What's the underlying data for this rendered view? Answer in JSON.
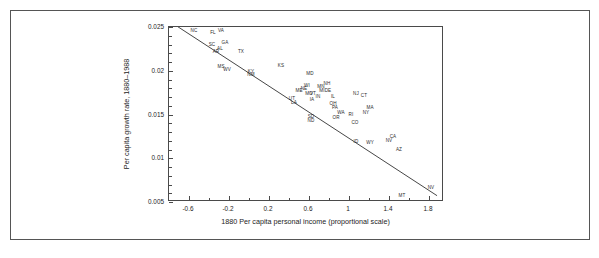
{
  "chart_data": {
    "type": "scatter",
    "title": "",
    "xlabel": "1880 Per capita personal income (proportional scale)",
    "ylabel": "Per capita growth rate, 1880–1988",
    "xlim": [
      -0.8,
      1.95
    ],
    "ylim": [
      0.005,
      0.025
    ],
    "xticks": [
      -0.6,
      -0.2,
      0.2,
      0.6,
      1,
      1.4,
      1.8
    ],
    "xticklabels": [
      "-0.6",
      "-0.2",
      "0.2",
      "0.6",
      "1",
      "1.4",
      "1.8"
    ],
    "xminor_step": 0.2,
    "yticks": [
      0.005,
      0.01,
      0.015,
      0.02,
      0.025
    ],
    "yticklabels": [
      "0.005",
      "0.01",
      "0.015",
      "0.02",
      "0.025"
    ],
    "yminor_step": 0.001,
    "grid": false,
    "legend": null,
    "point_label_field": "state",
    "fit_line": {
      "name": "regression line",
      "x": [
        -0.72,
        1.9
      ],
      "y": [
        0.0251,
        0.0055
      ]
    },
    "points": [
      {
        "state": "NC",
        "x": -0.55,
        "y": 0.0246
      },
      {
        "state": "FL",
        "x": -0.36,
        "y": 0.0243
      },
      {
        "state": "VA",
        "x": -0.28,
        "y": 0.0245
      },
      {
        "state": "SC",
        "x": -0.37,
        "y": 0.0229
      },
      {
        "state": "GA",
        "x": -0.24,
        "y": 0.0232
      },
      {
        "state": "AL",
        "x": -0.29,
        "y": 0.0225
      },
      {
        "state": "AR",
        "x": -0.33,
        "y": 0.0222
      },
      {
        "state": "TX",
        "x": -0.08,
        "y": 0.0222
      },
      {
        "state": "KS",
        "x": 0.32,
        "y": 0.0206
      },
      {
        "state": "MS",
        "x": -0.28,
        "y": 0.0204
      },
      {
        "state": "WV",
        "x": -0.22,
        "y": 0.0201
      },
      {
        "state": "KY",
        "x": 0.02,
        "y": 0.0199
      },
      {
        "state": "NM",
        "x": 0.02,
        "y": 0.0195
      },
      {
        "state": "MD",
        "x": 0.61,
        "y": 0.0196
      },
      {
        "state": "WI",
        "x": 0.58,
        "y": 0.0183
      },
      {
        "state": "NH",
        "x": 0.78,
        "y": 0.0185
      },
      {
        "state": "MN",
        "x": 0.72,
        "y": 0.0182
      },
      {
        "state": "NE",
        "x": 0.55,
        "y": 0.0179
      },
      {
        "state": "ME",
        "x": 0.5,
        "y": 0.0177
      },
      {
        "state": "MI",
        "x": 0.73,
        "y": 0.0177
      },
      {
        "state": "DE",
        "x": 0.79,
        "y": 0.0177
      },
      {
        "state": "VT",
        "x": 0.64,
        "y": 0.0174
      },
      {
        "state": "MO",
        "x": 0.6,
        "y": 0.0173
      },
      {
        "state": "IN",
        "x": 0.69,
        "y": 0.017
      },
      {
        "state": "IL",
        "x": 0.84,
        "y": 0.017
      },
      {
        "state": "IA",
        "x": 0.63,
        "y": 0.0167
      },
      {
        "state": "UT",
        "x": 0.43,
        "y": 0.0168
      },
      {
        "state": "LA",
        "x": 0.45,
        "y": 0.0163
      },
      {
        "state": "NJ",
        "x": 1.07,
        "y": 0.0174
      },
      {
        "state": "CT",
        "x": 1.15,
        "y": 0.0171
      },
      {
        "state": "OH",
        "x": 0.84,
        "y": 0.0162
      },
      {
        "state": "PA",
        "x": 0.86,
        "y": 0.0158
      },
      {
        "state": "MA",
        "x": 1.21,
        "y": 0.0157
      },
      {
        "state": "NY",
        "x": 1.17,
        "y": 0.0152
      },
      {
        "state": "SD",
        "x": 0.62,
        "y": 0.0147
      },
      {
        "state": "ND",
        "x": 0.62,
        "y": 0.0143
      },
      {
        "state": "WA",
        "x": 0.92,
        "y": 0.0152
      },
      {
        "state": "OR",
        "x": 0.87,
        "y": 0.0146
      },
      {
        "state": "RI",
        "x": 1.02,
        "y": 0.015
      },
      {
        "state": "CO",
        "x": 1.06,
        "y": 0.014
      },
      {
        "state": "ID",
        "x": 1.07,
        "y": 0.0119
      },
      {
        "state": "WY",
        "x": 1.21,
        "y": 0.0118
      },
      {
        "state": "CA",
        "x": 1.44,
        "y": 0.0124
      },
      {
        "state": "NV",
        "x": 1.4,
        "y": 0.012
      },
      {
        "state": "AZ",
        "x": 1.5,
        "y": 0.011
      },
      {
        "state": "MT",
        "x": 1.53,
        "y": 0.0057
      },
      {
        "state": "NV2",
        "x": 1.82,
        "y": 0.0066
      }
    ]
  }
}
